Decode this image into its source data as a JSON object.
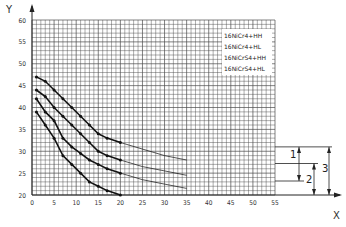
{
  "chart_data": {
    "type": "line",
    "title": "",
    "xlabel": "X",
    "ylabel": "Y",
    "xlim": [
      0,
      55
    ],
    "ylim": [
      20,
      60
    ],
    "grid": true,
    "grid_minor_step": 1,
    "x_ticks": [
      0,
      5,
      10,
      15,
      20,
      25,
      30,
      35,
      40,
      45,
      50,
      55
    ],
    "y_ticks": [
      20,
      25,
      30,
      35,
      40,
      45,
      50,
      55,
      60
    ],
    "legend_position": "upper-right-inside",
    "series": [
      {
        "name": "16NiCr4+HH",
        "x": [
          1,
          3,
          5,
          7,
          9,
          11,
          13,
          15,
          17,
          20,
          25,
          30,
          35
        ],
        "y": [
          47,
          46,
          44,
          42,
          40,
          38,
          36,
          34,
          33,
          32,
          30.5,
          29,
          28
        ],
        "solid_until_x": 20
      },
      {
        "name": "16NiCr4+HL",
        "x": [
          1,
          3,
          5,
          7,
          9,
          11,
          13,
          15,
          17,
          20,
          25,
          30,
          35
        ],
        "y": [
          44,
          42.5,
          40,
          38,
          36,
          34,
          32,
          30,
          29,
          28,
          26.5,
          25.5,
          24.5
        ],
        "solid_until_x": 20
      },
      {
        "name": "16NiCrS4+HH",
        "x": [
          1,
          3,
          5,
          7,
          9,
          11,
          13,
          15,
          17,
          20,
          25,
          30,
          35
        ],
        "y": [
          42,
          39,
          37,
          33,
          31,
          29.5,
          28,
          27,
          26,
          25,
          23.5,
          22.5,
          21.5
        ],
        "solid_until_x": 20
      },
      {
        "name": "16NiCrS4+HL",
        "x": [
          1,
          3,
          5,
          7,
          9,
          11,
          13,
          15,
          17,
          20
        ],
        "y": [
          39,
          36,
          33,
          29,
          27,
          25,
          23,
          22,
          21,
          20
        ],
        "solid_until_x": 20
      }
    ],
    "annotations": {
      "reference_lines_y": [
        31,
        27.2,
        23.2
      ],
      "dimensions": [
        {
          "label": "1",
          "from_y": 31,
          "to_y": 23.2
        },
        {
          "label": "2",
          "from_y": 27.2,
          "to_y": 20
        },
        {
          "label": "3",
          "from_y": 31,
          "to_y": 20
        }
      ]
    }
  },
  "labels": {
    "x_axis": "X",
    "y_axis": "Y",
    "legend": [
      "16NiCr4+HH",
      "16NiCr4+HL",
      "16NiCrS4+HH",
      "16NiCrS4+HL"
    ],
    "dim_1": "1",
    "dim_2": "2",
    "dim_3": "3",
    "x_ticks": [
      "0",
      "5",
      "10",
      "15",
      "20",
      "25",
      "30",
      "35",
      "40",
      "45",
      "50",
      "55"
    ],
    "y_ticks": [
      "20",
      "25",
      "30",
      "35",
      "40",
      "45",
      "50",
      "55",
      "60"
    ]
  },
  "colors": {
    "grid": "#4a4a4a",
    "curve": "#111111",
    "axis": "#222222",
    "background": "#ffffff"
  }
}
